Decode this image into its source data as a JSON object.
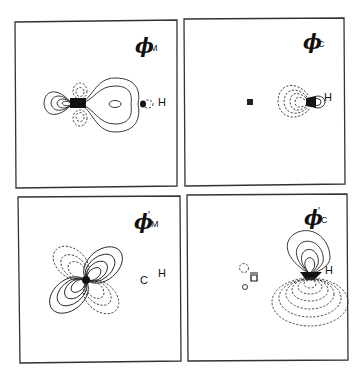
{
  "figure": {
    "panels": [
      {
        "id": "phi-M",
        "symbol": "ϕ",
        "prime": "",
        "subscript": "M",
        "atoms": [
          "H"
        ]
      },
      {
        "id": "phi-C",
        "symbol": "ϕ",
        "prime": "",
        "subscript": "C",
        "atoms": [
          "H"
        ]
      },
      {
        "id": "phi-prime-M",
        "symbol": "ϕ",
        "prime": "'",
        "subscript": "M",
        "atoms": [
          "C",
          "H"
        ]
      },
      {
        "id": "phi-prime-C",
        "symbol": "ϕ",
        "prime": "'",
        "subscript": "C",
        "atoms": [
          "H"
        ]
      }
    ],
    "legend": {
      "solid": "positive contour",
      "dashed": "negative contour"
    }
  }
}
